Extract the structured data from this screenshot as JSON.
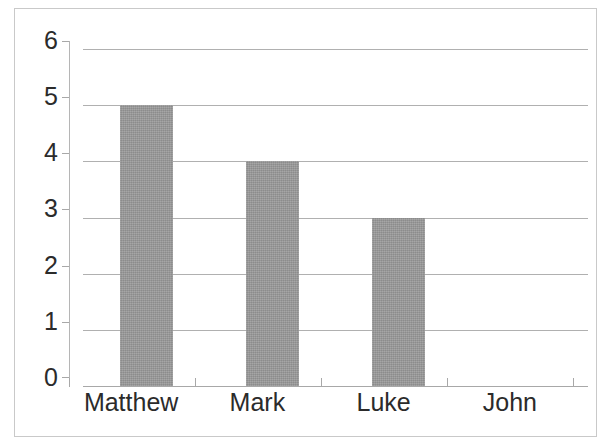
{
  "figure": {
    "background_color": "#ffffff",
    "frame_color": "#c9c9c9",
    "gridline_color": "#b0b0b0",
    "axis_color": "#a8a8a8",
    "bar_color": "#999999",
    "text_color": "#2b2b2b"
  },
  "chart_data": {
    "type": "bar",
    "title": "",
    "subtitle": "",
    "xlabel": "",
    "ylabel": "",
    "categories": [
      "Matthew",
      "Mark",
      "Luke",
      "John"
    ],
    "values": [
      5,
      4,
      3,
      0
    ],
    "series": [
      {
        "name": "",
        "values": [
          5,
          4,
          3,
          0
        ]
      }
    ],
    "ylim": [
      0,
      6
    ],
    "yticks": [
      0,
      1,
      2,
      3,
      4,
      5,
      6
    ],
    "ytick_labels": [
      "0",
      "1",
      "2",
      "3",
      "4",
      "5",
      "6"
    ],
    "xtick_labels": [
      "Matthew",
      "Mark",
      "Luke",
      "John"
    ],
    "grid": true,
    "grid_axis": "y",
    "legend": false,
    "legend_position": "none",
    "annotations": [],
    "bar_color": "#999999",
    "bar_orientation": "vertical"
  }
}
